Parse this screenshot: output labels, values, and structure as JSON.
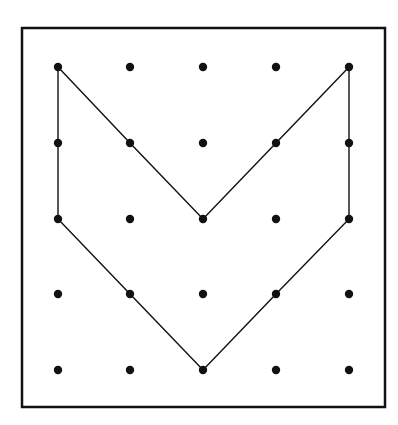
{
  "diagram": {
    "type": "geoboard",
    "grid": {
      "columns": 5,
      "rows": 5
    },
    "colors": {
      "background": "#ffffff",
      "ink": "#111111"
    },
    "frame": {
      "x": 22,
      "y": 28,
      "width": 363,
      "height": 379,
      "stroke_width": 2.5
    },
    "dot_x": [
      58,
      130,
      203,
      276,
      349
    ],
    "dot_y": [
      67,
      143,
      219,
      294,
      370
    ],
    "dot_radius": 4.2,
    "shape": {
      "name": "chevron",
      "vertices_grid": [
        [
          0,
          0
        ],
        [
          1,
          1
        ],
        [
          2,
          2
        ],
        [
          3,
          1
        ],
        [
          4,
          0
        ],
        [
          4,
          1
        ],
        [
          4,
          2
        ],
        [
          3,
          3
        ],
        [
          2,
          4
        ],
        [
          1,
          3
        ],
        [
          0,
          2
        ],
        [
          0,
          1
        ]
      ],
      "stroke_width": 1.4
    }
  }
}
